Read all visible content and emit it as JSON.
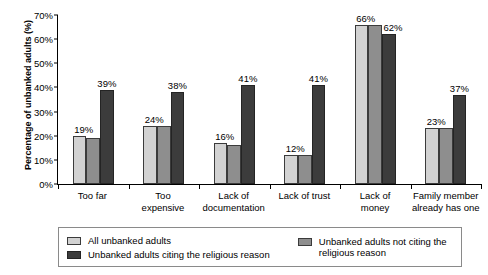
{
  "chart_data": {
    "type": "bar",
    "title": "",
    "xlabel": "",
    "ylabel": "Percentage of unbanked adults (%)",
    "ylim": [
      0,
      70
    ],
    "ytick_labels": [
      "0%",
      "10%",
      "20%",
      "30%",
      "40%",
      "50%",
      "60%",
      "70%"
    ],
    "ytick_values": [
      0,
      10,
      20,
      30,
      40,
      50,
      60,
      70
    ],
    "grid": false,
    "legend_position": "below",
    "categories": [
      "Too far",
      "Too expensive",
      "Lack of documentation",
      "Lack of trust",
      "Lack of money",
      "Family member already has one"
    ],
    "category_lines": [
      [
        "Too far"
      ],
      [
        "Too",
        "expensive"
      ],
      [
        "Lack of",
        "documentation"
      ],
      [
        "Lack of trust"
      ],
      [
        "Lack of",
        "money"
      ],
      [
        "Family member",
        "already has one"
      ]
    ],
    "series": [
      {
        "name": "All unbanked adults",
        "color": "#d2d2d2",
        "values": [
          20,
          24,
          17,
          12,
          66,
          23
        ],
        "labels": [
          "19%",
          "24%",
          "16%",
          "12%",
          "66%",
          "23%"
        ]
      },
      {
        "name": "Unbanked adults not citing the religious reason",
        "color": "#8e8e8e",
        "values": [
          19,
          24,
          16,
          12,
          66,
          23
        ],
        "labels": [
          "",
          "",
          "",
          "",
          "",
          ""
        ]
      },
      {
        "name": "Unbanked adults citing the religious reason",
        "color": "#3c3c3c",
        "values": [
          39,
          38,
          41,
          41,
          62,
          37
        ],
        "labels": [
          "39%",
          "38%",
          "41%",
          "41%",
          "62%",
          "37%"
        ]
      }
    ]
  },
  "legend": {
    "items": [
      {
        "label": "All unbanked adults",
        "swatch": "s0"
      },
      {
        "label": "Unbanked adults citing the religious reason",
        "swatch": "s2"
      },
      {
        "label": "Unbanked adults not citing the religious reason",
        "swatch": "s1"
      }
    ]
  }
}
